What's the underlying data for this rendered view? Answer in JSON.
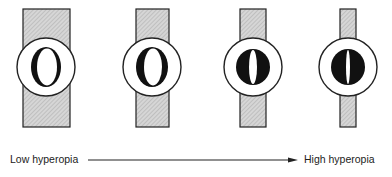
{
  "figure": {
    "panels": [
      {
        "id": "panel-1",
        "rect_x": 23,
        "rect_w": 47,
        "cx": 46,
        "pupil_type": "clear-oval",
        "pupil_rx": 15,
        "pupil_ry": 20,
        "slit_half": 11
      },
      {
        "id": "panel-2",
        "rect_x": 136,
        "rect_w": 33,
        "cx": 152,
        "pupil_type": "oval-shaded",
        "pupil_rx": 16,
        "pupil_ry": 20,
        "slit_half": 9
      },
      {
        "id": "panel-3",
        "rect_x": 240,
        "rect_w": 26,
        "cx": 253,
        "pupil_type": "dark-slit",
        "pupil_rx": 17,
        "pupil_ry": 18,
        "slit_half": 4
      },
      {
        "id": "panel-4",
        "rect_x": 340,
        "rect_w": 16,
        "cx": 348,
        "pupil_type": "dark-slit",
        "pupil_rx": 17,
        "pupil_ry": 18,
        "slit_half": 2
      }
    ],
    "circle_cy": 67,
    "circle_r": 29,
    "rect_top": 9,
    "rect_bottom": 127,
    "hatch_color": "#bdbdbd",
    "stroke_color": "#222222"
  },
  "axis": {
    "low_label": "Low hyperopia",
    "high_label": "High hyperopia",
    "arrow_x1": 88,
    "arrow_x2": 298,
    "arrow_y": 160
  }
}
